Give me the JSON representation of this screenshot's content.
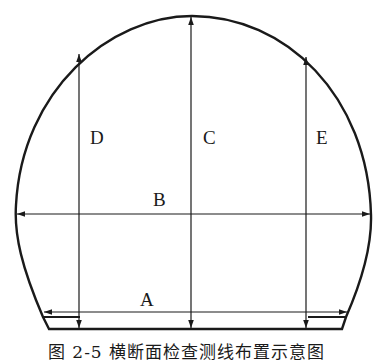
{
  "figure": {
    "caption": "图 2-5  横断面检查测线布置示意图",
    "stroke_color": "#1a1a1a",
    "background": "#ffffff"
  },
  "measure_lines": [
    {
      "label": "A",
      "orientation": "horizontal",
      "position": "bottom, near invert"
    },
    {
      "label": "B",
      "orientation": "horizontal",
      "position": "springline, widest span"
    },
    {
      "label": "C",
      "orientation": "vertical",
      "position": "center, crown to floor"
    },
    {
      "label": "D",
      "orientation": "vertical",
      "position": "left, arch to floor"
    },
    {
      "label": "E",
      "orientation": "vertical",
      "position": "right, arch to floor"
    }
  ],
  "labels": {
    "a": "A",
    "b": "B",
    "c": "C",
    "d": "D",
    "e": "E"
  }
}
